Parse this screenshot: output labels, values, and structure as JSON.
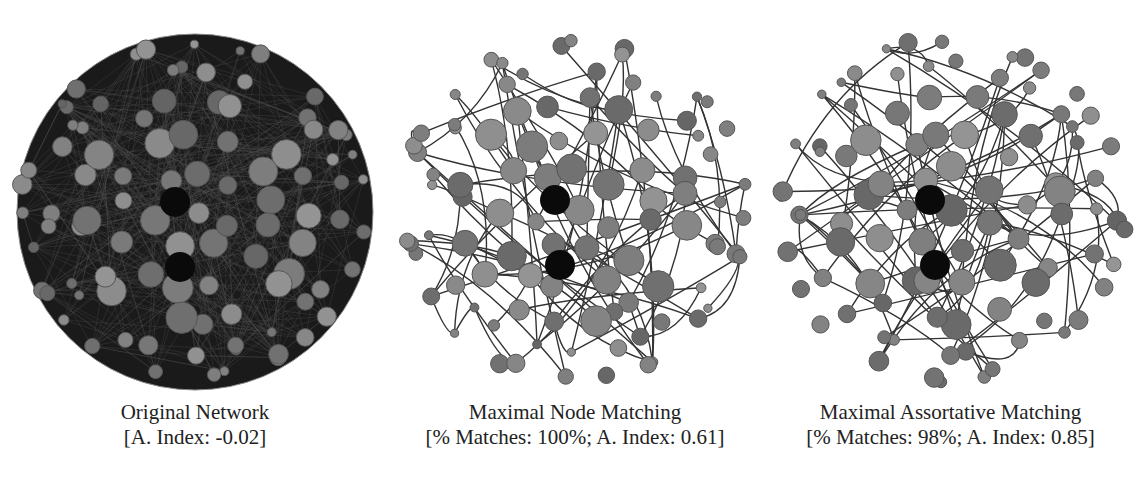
{
  "figure": {
    "panels": [
      {
        "id": "original",
        "title": "Original Network",
        "subtitle": "[A. Index: -0.02]",
        "assortativity_index": -0.02,
        "edge_style": "dense",
        "colors": {
          "node_fill": "#7a7a7a",
          "node_stroke": "#555555",
          "edge": "#222222",
          "hub": "#0a0a0a"
        }
      },
      {
        "id": "node-matching",
        "title": "Maximal Node Matching",
        "subtitle": "[% Matches: 100%; A. Index: 0.61]",
        "percent_matches": "100%",
        "assortativity_index": 0.61,
        "edge_style": "sparse-curved",
        "colors": {
          "node_fill": "#7a7a7a",
          "node_stroke": "#555555",
          "edge": "#333333",
          "hub": "#0a0a0a"
        }
      },
      {
        "id": "assortative-matching",
        "title": "Maximal Assortative Matching",
        "subtitle": "[% Matches: 98%; A. Index: 0.85]",
        "percent_matches": "98%",
        "assortativity_index": 0.85,
        "edge_style": "sparse-curved",
        "colors": {
          "node_fill": "#7a7a7a",
          "node_stroke": "#555555",
          "edge": "#333333",
          "hub": "#0a0a0a"
        }
      }
    ]
  }
}
